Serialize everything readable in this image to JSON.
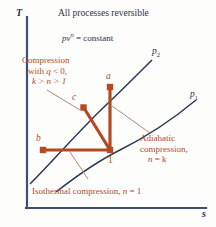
{
  "figure": {
    "title": "All processes reversible",
    "equation_text": "pv n = constant",
    "equation_base": "pv",
    "equation_exponent": "n",
    "equation_rhs": "= constant",
    "axes": {
      "y_label": "T",
      "x_label": "s"
    },
    "colors": {
      "process_line": "#b5491f",
      "curve_line": "#2b3a55",
      "axis": "#40506b",
      "leader": "#b08a78",
      "note_text": "#b5491f",
      "plain_text": "#2a3346",
      "background": "#fdfdfc"
    },
    "pressure_curves": [
      {
        "name": "p2",
        "label_base": "p",
        "label_sub": "2"
      },
      {
        "name": "p1",
        "label_base": "p",
        "label_sub": "1"
      }
    ],
    "state_points": [
      {
        "id": "a",
        "label": "a",
        "x": 110,
        "y": 86
      },
      {
        "id": "c",
        "label": "c",
        "x": 83,
        "y": 107
      },
      {
        "id": "b",
        "label": "b",
        "x": 42,
        "y": 150
      },
      {
        "id": "one",
        "label": "1",
        "x": 110,
        "y": 150
      }
    ],
    "annotations": [
      {
        "name": "polytropic-note",
        "lines": [
          "Compression",
          "with q < 0,",
          "k > n > 1"
        ],
        "line1": "Compression",
        "line2_pre": "with ",
        "line2_var": "q",
        "line2_post": " < 0,",
        "line3": "k > n > 1"
      },
      {
        "name": "adiabatic-note",
        "lines": [
          "Adiabatic",
          "compression,",
          "n = k"
        ],
        "line1": "Adiabatic",
        "line2": "compression,",
        "line3_var": "n",
        "line3_post": " = k"
      },
      {
        "name": "isothermal-note",
        "text": "Isothermal compression, n = 1",
        "text_pre": "Isothermal compression, ",
        "text_var": "n",
        "text_post": " = 1"
      }
    ]
  }
}
